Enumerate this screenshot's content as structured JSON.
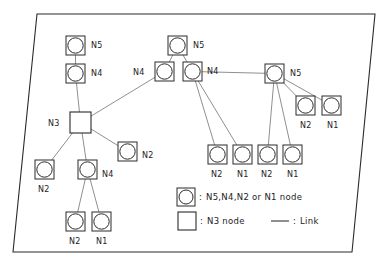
{
  "figure": {
    "type": "network-topology-diagram",
    "frame": {
      "shape": "parallelogram",
      "points": "37,14 375,14 352,252 13,252"
    },
    "colors": {
      "frame_stroke": "#2b2b2b",
      "node_stroke": "#2b2b2b",
      "link_stroke": "#6a6a6a",
      "text": "#1c1c1c",
      "background": "#ffffff"
    }
  },
  "nodes": [
    {
      "id": "n5_left",
      "kind": "circle",
      "label": "N5",
      "x": 66,
      "y": 36,
      "label_x": 91,
      "label_y": 42
    },
    {
      "id": "n4_left",
      "kind": "circle",
      "label": "N4",
      "x": 66,
      "y": 64,
      "label_x": 91,
      "label_y": 70
    },
    {
      "id": "n3_center_left",
      "kind": "square",
      "label": "N3",
      "x": 70,
      "y": 112,
      "label_x": 48,
      "label_y": 120
    },
    {
      "id": "n2_lower_left",
      "kind": "circle",
      "label": "N2",
      "x": 35,
      "y": 160,
      "label_x": 38,
      "label_y": 186
    },
    {
      "id": "n4_lower_left",
      "kind": "circle",
      "label": "N4",
      "x": 78,
      "y": 160,
      "label_x": 102,
      "label_y": 171
    },
    {
      "id": "n2_mid_left",
      "kind": "circle",
      "label": "N2",
      "x": 118,
      "y": 142,
      "label_x": 142,
      "label_y": 152
    },
    {
      "id": "n2_bottom_a",
      "kind": "circle",
      "label": "N2",
      "x": 66,
      "y": 212,
      "label_x": 69,
      "label_y": 238
    },
    {
      "id": "n1_bottom_a",
      "kind": "circle",
      "label": "N1",
      "x": 92,
      "y": 212,
      "label_x": 96,
      "label_y": 238
    },
    {
      "id": "n5_center",
      "kind": "circle",
      "label": "N5",
      "x": 168,
      "y": 36,
      "label_x": 193,
      "label_y": 42
    },
    {
      "id": "n4_center_l",
      "kind": "circle",
      "label": "N4",
      "x": 155,
      "y": 62,
      "label_x": 133,
      "label_y": 69
    },
    {
      "id": "n4_center_r",
      "kind": "circle",
      "label": "N4",
      "x": 183,
      "y": 62,
      "label_x": 207,
      "label_y": 68
    },
    {
      "id": "n5_right",
      "kind": "circle",
      "label": "N5",
      "x": 265,
      "y": 64,
      "label_x": 290,
      "label_y": 70
    },
    {
      "id": "n2_right_a",
      "kind": "circle",
      "label": "N2",
      "x": 296,
      "y": 96,
      "label_x": 300,
      "label_y": 122
    },
    {
      "id": "n1_right_a",
      "kind": "circle",
      "label": "N1",
      "x": 322,
      "y": 96,
      "label_x": 327,
      "label_y": 122
    },
    {
      "id": "n2_row_a",
      "kind": "circle",
      "label": "N2",
      "x": 208,
      "y": 145,
      "label_x": 211,
      "label_y": 171
    },
    {
      "id": "n1_row_a",
      "kind": "circle",
      "label": "N1",
      "x": 233,
      "y": 145,
      "label_x": 237,
      "label_y": 171
    },
    {
      "id": "n2_row_b",
      "kind": "circle",
      "label": "N2",
      "x": 258,
      "y": 145,
      "label_x": 261,
      "label_y": 171
    },
    {
      "id": "n1_row_b",
      "kind": "circle",
      "label": "N1",
      "x": 283,
      "y": 145,
      "label_x": 287,
      "label_y": 171
    }
  ],
  "links": [
    {
      "from": "n5_left",
      "to": "n4_left"
    },
    {
      "from": "n4_left",
      "to": "n3_center_left"
    },
    {
      "from": "n3_center_left",
      "to": "n4_center_l"
    },
    {
      "from": "n3_center_left",
      "to": "n2_lower_left"
    },
    {
      "from": "n3_center_left",
      "to": "n4_lower_left"
    },
    {
      "from": "n3_center_left",
      "to": "n2_mid_left"
    },
    {
      "from": "n4_lower_left",
      "to": "n2_bottom_a"
    },
    {
      "from": "n4_lower_left",
      "to": "n1_bottom_a"
    },
    {
      "from": "n5_center",
      "to": "n4_center_l"
    },
    {
      "from": "n5_center",
      "to": "n4_center_r"
    },
    {
      "from": "n4_center_r",
      "to": "n5_right"
    },
    {
      "from": "n4_center_r",
      "to": "n2_row_a"
    },
    {
      "from": "n4_center_r",
      "to": "n1_row_a"
    },
    {
      "from": "n5_right",
      "to": "n2_right_a"
    },
    {
      "from": "n5_right",
      "to": "n1_right_a"
    },
    {
      "from": "n5_right",
      "to": "n2_row_b"
    },
    {
      "from": "n5_right",
      "to": "n1_row_b"
    }
  ],
  "legend": {
    "rows": [
      {
        "id": "legend-circle-node",
        "symbol": "circle-in-square",
        "colon": ":",
        "text": "N5,N4,N2 or N1 node"
      },
      {
        "id": "legend-square-node",
        "symbol": "square",
        "colon": ":",
        "text": "N3 node"
      },
      {
        "id": "legend-link",
        "symbol": "line",
        "colon": ":",
        "text": "Link"
      }
    ]
  }
}
